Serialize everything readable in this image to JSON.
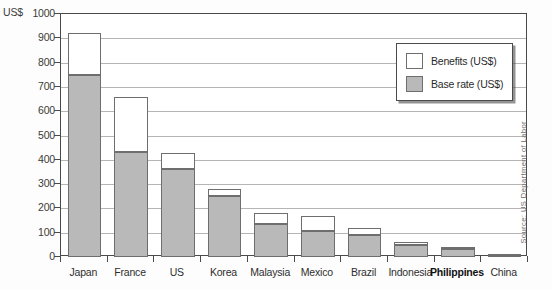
{
  "axis": {
    "unit_label": "US$",
    "y_ticks": [
      0,
      100,
      200,
      300,
      400,
      500,
      600,
      700,
      800,
      900,
      1000
    ]
  },
  "legend": {
    "items": [
      {
        "label": "Benefits (US$)",
        "swatch": "white",
        "color": "#ffffff"
      },
      {
        "label": "Base rate (US$)",
        "swatch": "gray",
        "color": "#b9b9b9"
      }
    ]
  },
  "source": {
    "text": "Source: US Department of Labor"
  },
  "chart_data": {
    "type": "bar",
    "stacked": true,
    "title": "",
    "subtitle": "",
    "xlabel": "",
    "ylabel": "US$",
    "ylim": [
      0,
      1000
    ],
    "ytick_step": 100,
    "grid": true,
    "legend_position": "top-right",
    "highlight_category": "Philippines",
    "categories": [
      "Japan",
      "France",
      "US",
      "Korea",
      "Malaysia",
      "Mexico",
      "Brazil",
      "Indonesia",
      "Philippines",
      "China"
    ],
    "series": [
      {
        "name": "Base rate (US$)",
        "color": "#b9b9b9",
        "values": [
          748,
          432,
          364,
          250,
          136,
          108,
          90,
          50,
          32,
          10
        ]
      },
      {
        "name": "Benefits (US$)",
        "color": "#ffffff",
        "values": [
          172,
          228,
          66,
          30,
          44,
          62,
          28,
          13,
          8,
          2
        ]
      }
    ],
    "totals": [
      920,
      660,
      430,
      280,
      180,
      170,
      118,
      63,
      40,
      12
    ]
  }
}
